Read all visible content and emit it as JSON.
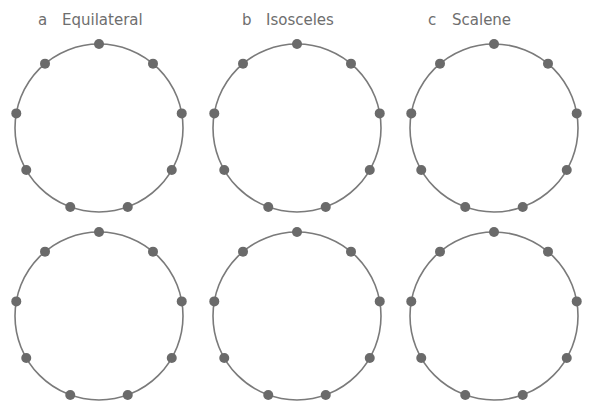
{
  "panels": [
    {
      "letter": "a",
      "title": "Equilateral",
      "cx": 99,
      "label_x": 38
    },
    {
      "letter": "b",
      "title": "Isosceles",
      "cx": 297,
      "label_x": 240
    },
    {
      "letter": "c",
      "title": "Scalene",
      "cx": 494,
      "label_x": 428
    }
  ],
  "rows": [
    {
      "cy": 128
    },
    {
      "cy": 316
    }
  ],
  "circle": {
    "radius": 84,
    "points_per_circle": 9,
    "dot_radius": 5
  },
  "colors": {
    "stroke": "#7a7a7a",
    "dot": "#6a6a6a",
    "label": "#6e6e6e"
  }
}
